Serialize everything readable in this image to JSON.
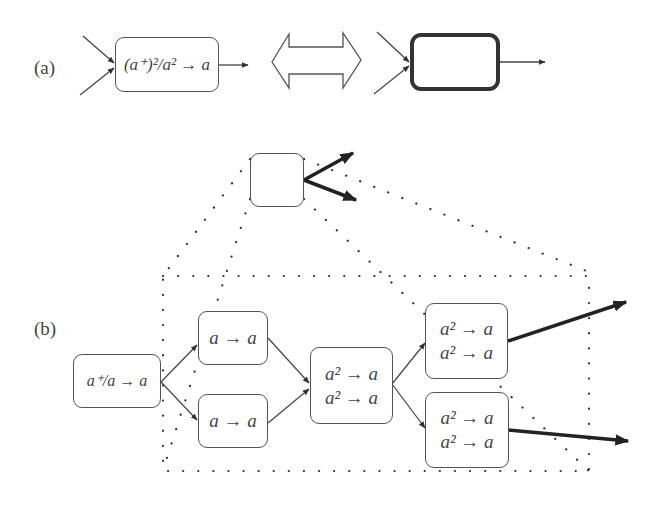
{
  "panel_a": {
    "label": "(a)",
    "source_node": {
      "text": "(a⁺)²/a² → a"
    },
    "equivalence_arrow": "double-headed-outline-arrow",
    "abstract_node": {
      "text": ""
    }
  },
  "panel_b": {
    "label": "(b)",
    "abstract_node": {
      "text": ""
    },
    "nodes": [
      {
        "id": "n0",
        "lines": [
          "a⁺/a → a"
        ]
      },
      {
        "id": "n1",
        "lines": [
          "a → a"
        ]
      },
      {
        "id": "n2",
        "lines": [
          "a → a"
        ]
      },
      {
        "id": "n3",
        "lines": [
          "a² → a",
          "a² → a"
        ]
      },
      {
        "id": "n4",
        "lines": [
          "a² → a",
          "a² → a"
        ]
      },
      {
        "id": "n5",
        "lines": [
          "a² → a",
          "a² → a"
        ]
      }
    ],
    "edges": [
      [
        "n0",
        "n1"
      ],
      [
        "n0",
        "n2"
      ],
      [
        "n1",
        "n3"
      ],
      [
        "n2",
        "n3"
      ],
      [
        "n3",
        "n4"
      ],
      [
        "n3",
        "n5"
      ]
    ],
    "outputs": [
      "n4",
      "n5"
    ]
  }
}
